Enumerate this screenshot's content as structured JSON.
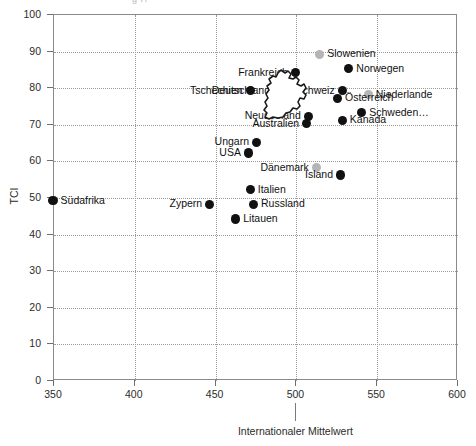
{
  "header": {
    "cutoff_text": "g  H"
  },
  "chart_data": {
    "type": "scatter",
    "title": "",
    "xlabel": "Internationaler Mittelwert",
    "ylabel": "TCI",
    "xlim": [
      350,
      600
    ],
    "ylim": [
      0,
      100
    ],
    "xticks": [
      350,
      400,
      450,
      500,
      550,
      600
    ],
    "yticks": [
      0,
      10,
      20,
      30,
      40,
      50,
      60,
      70,
      80,
      90,
      100
    ],
    "grid": true,
    "legend": "none",
    "annotations": [
      {
        "name": "international-mean",
        "text": "Internationaler Mittelwert",
        "x": 500
      }
    ],
    "marker_colors": {
      "highlight": "#b5b5b5",
      "normal": "#111111"
    },
    "points": [
      {
        "label": "Südafrika",
        "x": 350,
        "y": 49,
        "color": "normal",
        "label_pos": "right"
      },
      {
        "label": "Zypern",
        "x": 447,
        "y": 48,
        "color": "normal",
        "label_pos": "left"
      },
      {
        "label": "Litauen",
        "x": 463,
        "y": 44,
        "color": "normal",
        "label_pos": "right"
      },
      {
        "label": "Russland",
        "x": 474,
        "y": 48,
        "color": "normal",
        "label_pos": "right"
      },
      {
        "label": "Italien",
        "x": 472,
        "y": 52,
        "color": "normal",
        "label_pos": "right"
      },
      {
        "label": "USA",
        "x": 471,
        "y": 62,
        "color": "normal",
        "label_pos": "left"
      },
      {
        "label": "Ungarn",
        "x": 476,
        "y": 65,
        "color": "normal",
        "label_pos": "left"
      },
      {
        "label": "Deutschland",
        "x": 489,
        "y": 79,
        "color": "normal",
        "label_pos": "left"
      },
      {
        "label": "Tschechien",
        "x": 472,
        "y": 79,
        "color": "normal",
        "label_pos": "left"
      },
      {
        "label": "Frankreich",
        "x": 500,
        "y": 84,
        "color": "normal",
        "label_pos": "left"
      },
      {
        "label": "Slowenien",
        "x": 515,
        "y": 89,
        "color": "highlight",
        "label_pos": "right"
      },
      {
        "label": "Norwegen",
        "x": 533,
        "y": 85,
        "color": "normal",
        "label_pos": "right"
      },
      {
        "label": "Schweiz",
        "x": 529,
        "y": 79,
        "color": "normal",
        "label_pos": "left"
      },
      {
        "label": "Österreich",
        "x": 526,
        "y": 77,
        "color": "normal",
        "label_pos": "right"
      },
      {
        "label": "Niederlande",
        "x": 545,
        "y": 78,
        "color": "highlight",
        "label_pos": "right"
      },
      {
        "label": "Schweden…",
        "x": 541,
        "y": 73,
        "color": "normal",
        "label_pos": "right"
      },
      {
        "label": "Neuseeland",
        "x": 508,
        "y": 72,
        "color": "normal",
        "label_pos": "left"
      },
      {
        "label": "Australien",
        "x": 507,
        "y": 70,
        "color": "normal",
        "label_pos": "left"
      },
      {
        "label": "Kanada",
        "x": 529,
        "y": 71,
        "color": "normal",
        "label_pos": "right"
      },
      {
        "label": "Dänemark",
        "x": 513,
        "y": 58,
        "color": "highlight",
        "label_pos": "left"
      },
      {
        "label": "Island",
        "x": 528,
        "y": 56,
        "color": "normal",
        "label_pos": "left"
      }
    ]
  }
}
